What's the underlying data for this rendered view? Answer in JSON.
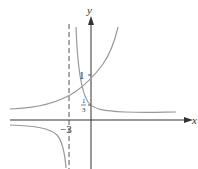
{
  "figure": {
    "axes": {
      "x_label": "x",
      "y_label": "y"
    },
    "ticks": {
      "y_one": "1",
      "y_third_num": "1",
      "y_third_den": "3",
      "x_asymptote": "−3"
    },
    "curves": [
      {
        "name": "exponential-growth-curve",
        "description": "increasing curve passing through (0,1)"
      },
      {
        "name": "rational-curve",
        "description": "hyperbola with vertical asymptote x=-3 passing through (0,1/3)"
      }
    ],
    "asymptote": {
      "label": "x = -3",
      "style": "dashed"
    },
    "colors": {
      "axis": "#333333",
      "curve": "#999999",
      "dashed": "#555555"
    }
  }
}
